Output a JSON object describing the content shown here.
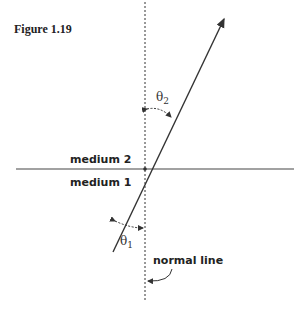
{
  "figure": {
    "caption": "Figure 1.19",
    "labels": {
      "medium_top": "medium 2",
      "medium_bottom": "medium 1",
      "normal": "normal line",
      "theta1": "θ",
      "theta1_sub": "1",
      "theta2": "θ",
      "theta2_sub": "2"
    },
    "colors": {
      "line": "#333333",
      "text": "#222222"
    }
  }
}
